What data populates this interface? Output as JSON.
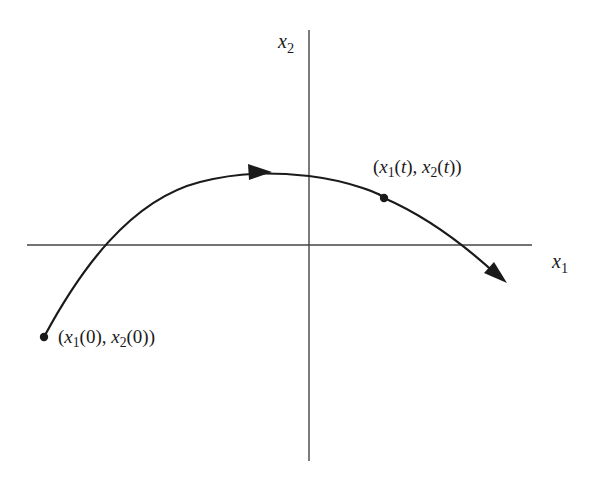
{
  "diagram": {
    "type": "phase-plane-trajectory",
    "axes": {
      "horizontal": {
        "label_var": "x",
        "label_sub": "1"
      },
      "vertical": {
        "label_var": "x",
        "label_sub": "2"
      }
    },
    "points": {
      "initial": {
        "open": "(",
        "v1": "x",
        "s1": "1",
        "arg1": "(0)",
        "sep": ", ",
        "v2": "x",
        "s2": "2",
        "arg2": "(0)",
        "close": ")"
      },
      "current": {
        "open": "(",
        "v1": "x",
        "s1": "1",
        "arg1a": "(",
        "t1": "t",
        "arg1b": ")",
        "sep": ", ",
        "v2": "x",
        "s2": "2",
        "arg2a": "(",
        "t2": "t",
        "arg2b": ")",
        "close": ")"
      }
    },
    "colors": {
      "curve": "#1a1a1a",
      "axes": "#333333",
      "background": "#ffffff"
    }
  }
}
